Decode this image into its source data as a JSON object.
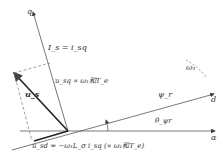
{
  "diagram": {
    "type": "vector-diagram",
    "axes": {
      "q": "q",
      "d": "d",
      "alpha": "α"
    },
    "labels": {
      "is": "I_s = i_sq",
      "us": "u_s",
      "usq": "u_sq ∝ ω₁和T_e",
      "usd": "u_sd = −ω₁L_σ i_sq (∝ ω₁和T_e)",
      "psi_r": "ψ_r",
      "theta": "θ_ψr",
      "omega": "ω₁"
    }
  }
}
